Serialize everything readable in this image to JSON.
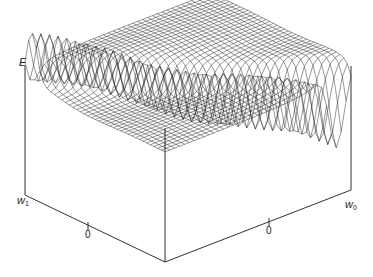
{
  "chart_data": {
    "type": "surface-wireframe",
    "title": "",
    "axes": {
      "z": {
        "label": "E"
      },
      "x": {
        "label": "w",
        "subscript": "1",
        "ticks": [
          "0"
        ]
      },
      "y": {
        "label": "w",
        "subscript": "0",
        "ticks": [
          "0"
        ]
      }
    },
    "grid": false,
    "legend": null
  },
  "caption": {
    "text": "",
    "note": "caption text cut off at bottom edge of image"
  },
  "colors": {
    "line": "#1a1a1a",
    "background": "#ffffff"
  }
}
